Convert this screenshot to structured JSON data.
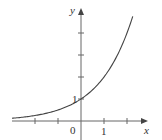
{
  "chart_data": {
    "type": "line",
    "title": "",
    "function": "y = 2^x",
    "xlabel": "x",
    "ylabel": "y",
    "x_tick_labels": [
      "0",
      "1"
    ],
    "y_tick_labels": [
      "1"
    ],
    "x_ticks": [
      -2,
      -1,
      0,
      1,
      2
    ],
    "y_ticks": [
      1,
      2,
      3,
      4
    ],
    "xlim": [
      -2,
      3
    ],
    "ylim": [
      0,
      5
    ],
    "grid": false,
    "series": [
      {
        "name": "curve",
        "x": [
          -1.9,
          -1.5,
          -1,
          -0.5,
          0,
          0.5,
          1,
          1.5,
          2,
          2.25
        ],
        "values": [
          0.27,
          0.35,
          0.5,
          0.71,
          1,
          1.41,
          2,
          2.83,
          4,
          4.76
        ]
      }
    ],
    "colors": {
      "axis": "#555555",
      "curve": "#444444"
    }
  },
  "labels": {
    "x_axis": "x",
    "y_axis": "y",
    "origin": "0",
    "x_one": "1",
    "y_one": "1"
  }
}
